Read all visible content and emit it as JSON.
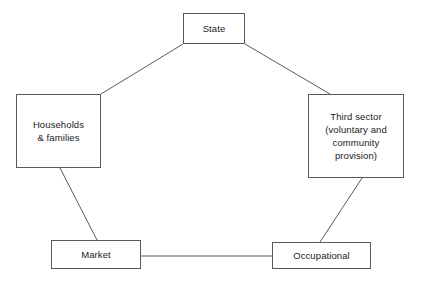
{
  "diagram": {
    "type": "pentagon-network",
    "line_color": "#595959",
    "box_border_color": "#595959",
    "background_color": "#ffffff",
    "text_color": "#1b1b1b",
    "nodes": [
      {
        "id": "state",
        "label": "State"
      },
      {
        "id": "households",
        "label": "Households\n& families"
      },
      {
        "id": "third_sector",
        "label": "Third sector\n(voluntary and\ncommunity\nprovision)"
      },
      {
        "id": "market",
        "label": "Market"
      },
      {
        "id": "occupational",
        "label": "Occupational"
      }
    ],
    "connections": [
      {
        "from": "state",
        "to": "households"
      },
      {
        "from": "state",
        "to": "third_sector"
      },
      {
        "from": "households",
        "to": "market"
      },
      {
        "from": "third_sector",
        "to": "occupational"
      },
      {
        "from": "market",
        "to": "occupational"
      }
    ]
  }
}
